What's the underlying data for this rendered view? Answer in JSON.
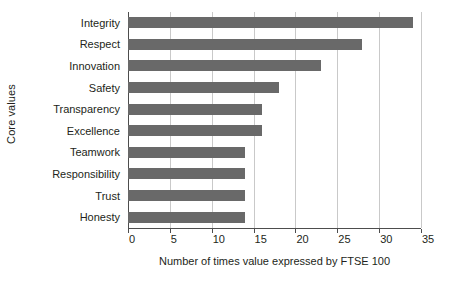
{
  "chart_data": {
    "type": "bar",
    "orientation": "horizontal",
    "title": "",
    "xlabel": "Number of times value expressed by FTSE 100",
    "ylabel": "Core values",
    "categories": [
      "Integrity",
      "Respect",
      "Innovation",
      "Safety",
      "Transparency",
      "Excellence",
      "Teamwork",
      "Responsibility",
      "Trust",
      "Honesty"
    ],
    "values": [
      34,
      28,
      23,
      18,
      16,
      16,
      14,
      14,
      14,
      14
    ],
    "xlim": [
      0,
      35
    ],
    "xticks": [
      0,
      5,
      10,
      15,
      20,
      25,
      30,
      35
    ],
    "xtick_labels": [
      "0",
      "5",
      "10",
      "15",
      "20",
      "25",
      "30",
      "35"
    ],
    "grid": "vertical",
    "legend": "none",
    "bar_color": "#696969",
    "gridline_color": "#c9c9c9",
    "axis_color": "#4d4d4d",
    "background_color": "#ffffff"
  }
}
